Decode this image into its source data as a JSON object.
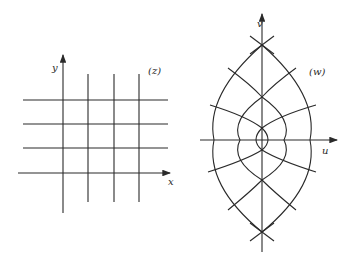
{
  "diagram": {
    "type": "conformal-mapping",
    "left_panel": {
      "plane_label": "(z)",
      "x_axis_label": "x",
      "y_axis_label": "y",
      "grid": {
        "vertical_lines": 3,
        "horizontal_lines": 3
      }
    },
    "right_panel": {
      "plane_label": "(w)",
      "u_axis_label": "u",
      "v_axis_label": "v"
    },
    "colors": {
      "line": "#2a2a2a",
      "background": "#ffffff"
    }
  }
}
